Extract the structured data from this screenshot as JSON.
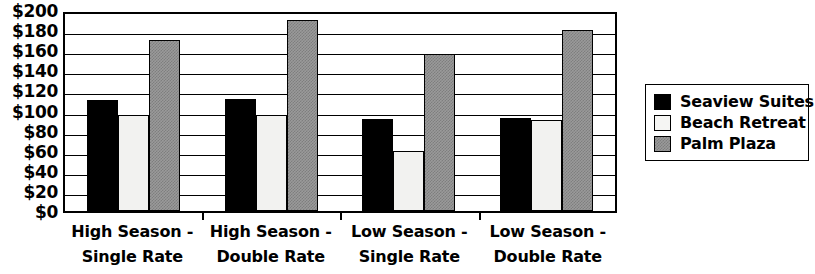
{
  "chart_data": {
    "type": "bar",
    "title": "",
    "subtitle": "",
    "xlabel": "",
    "ylabel": "",
    "ylim": [
      0,
      200
    ],
    "ytick_step": 20,
    "ytick_labels": [
      "$200",
      "$180",
      "$160",
      "$140",
      "$120",
      "$100",
      "$80",
      "$60",
      "$40",
      "$20",
      "$0"
    ],
    "ytick_values": [
      200,
      180,
      160,
      140,
      120,
      100,
      80,
      60,
      40,
      20,
      0
    ],
    "grid": true,
    "legend_position": "right",
    "categories": [
      "High Season - Single Rate",
      "High Season - Double Rate",
      "Low Season - Single Rate",
      "Low Season - Double Rate"
    ],
    "category_lines": [
      [
        "High Season -",
        "Single Rate"
      ],
      [
        "High Season -",
        "Double Rate"
      ],
      [
        "Low Season -",
        "Single Rate"
      ],
      [
        "Low Season -",
        "Double Rate"
      ]
    ],
    "series": [
      {
        "name": "Seaview Suites",
        "color": "#000000",
        "values": [
          110,
          111,
          92,
          93
        ]
      },
      {
        "name": "Beach Retreat",
        "color": "#f2f2f0",
        "values": [
          96,
          96,
          60,
          91
        ]
      },
      {
        "name": "Palm Plaza",
        "color": "#9a9a9a",
        "values": [
          170,
          190,
          156,
          180
        ]
      }
    ]
  },
  "legend": {
    "items": [
      {
        "label": "Seaview Suites",
        "swatch": "black-filled-swatch"
      },
      {
        "label": "Beach Retreat",
        "swatch": "white-filled-swatch"
      },
      {
        "label": "Palm Plaza",
        "swatch": "gray-textured-swatch"
      }
    ]
  }
}
